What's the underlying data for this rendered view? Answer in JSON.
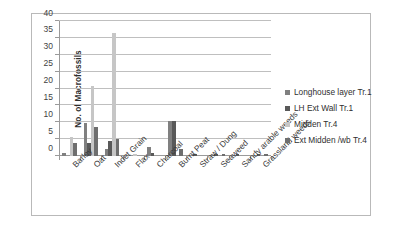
{
  "chart_data": {
    "type": "bar",
    "title": "",
    "xlabel": "",
    "ylabel": "No. of Macrofossils",
    "ylim": [
      0,
      40
    ],
    "yticks": [
      0,
      5,
      10,
      15,
      20,
      25,
      30,
      35,
      40
    ],
    "grid": true,
    "legend_position": "right",
    "categories": [
      "Barley",
      "Oat",
      "Indet Grain",
      "Flax",
      "Charcoal",
      "Burnt Peat",
      "Straw / Dung",
      "Seaweed",
      "Sandy arable weeds",
      "Grassland weeds"
    ],
    "series": [
      {
        "name": "Longhouse layer Tr.1",
        "color": "#808080",
        "values": [
          1.0,
          9.8,
          2.0,
          0,
          2.6,
          10.4,
          0,
          0,
          0,
          0
        ]
      },
      {
        "name": "LH Ext Wall Tr.1",
        "color": "#595959",
        "values": [
          0,
          3.9,
          4.4,
          0,
          1.0,
          10.4,
          0.6,
          0.7,
          0.7,
          0.7
        ]
      },
      {
        "name": "Midden Tr.4",
        "color": "#c6c6c6",
        "values": [
          5.5,
          20.7,
          36.5,
          0.5,
          0,
          0,
          0,
          0,
          0,
          0
        ]
      },
      {
        "name": "Ext Midden /wb Tr.4",
        "color": "#6e6e6e",
        "values": [
          3.9,
          8.7,
          5.0,
          0,
          0,
          2.0,
          0,
          0.7,
          0,
          0.7
        ]
      }
    ]
  },
  "legend": {
    "items": [
      {
        "label": "Longhouse layer Tr.1",
        "color": "#808080"
      },
      {
        "label": "LH Ext Wall Tr.1",
        "color": "#595959"
      },
      {
        "label": "Midden Tr.4",
        "color": "#c6c6c6"
      },
      {
        "label": "Ext Midden /wb Tr.4",
        "color": "#6e6e6e"
      }
    ]
  }
}
